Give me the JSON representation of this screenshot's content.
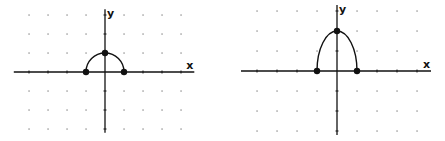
{
  "graphs": [
    {
      "id": "left",
      "axis_labels": {
        "x": "x",
        "y": "y"
      },
      "origin_px": [
        105,
        72
      ],
      "unit_px": 19,
      "grid": {
        "x_range": [
          -4,
          4
        ],
        "y_range": [
          -3,
          3
        ]
      },
      "curve": {
        "type": "semicircle",
        "x_intercepts": [
          -1,
          1
        ],
        "y_intercept": 1
      },
      "points": [
        {
          "x": -1,
          "y": 0
        },
        {
          "x": 0,
          "y": 1
        },
        {
          "x": 1,
          "y": 0
        }
      ]
    },
    {
      "id": "right",
      "axis_labels": {
        "x": "x",
        "y": "y"
      },
      "origin_px": [
        337,
        71
      ],
      "unit_px": 20,
      "grid": {
        "x_range": [
          -4,
          4
        ],
        "y_range": [
          -3,
          3
        ]
      },
      "curve": {
        "type": "semi-ellipse",
        "x_intercepts": [
          -1,
          1
        ],
        "y_intercept": 2
      },
      "points": [
        {
          "x": -1,
          "y": 0
        },
        {
          "x": 0,
          "y": 2
        },
        {
          "x": 1,
          "y": 0
        }
      ]
    }
  ],
  "colors": {
    "ink": "#111111",
    "grid_dot": "#888888",
    "background": "#ffffff"
  }
}
